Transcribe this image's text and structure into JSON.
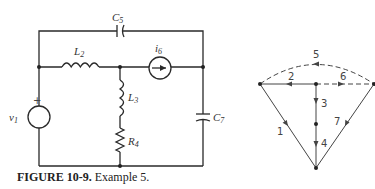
{
  "caption": {
    "label": "FIGURE 10-9.",
    "text": "Example 5."
  },
  "circuit": {
    "components": [
      {
        "id": "v1",
        "type": "voltage-source",
        "name": "v",
        "sub": "1",
        "polarity": "+"
      },
      {
        "id": "L2",
        "type": "inductor",
        "name": "L",
        "sub": "2"
      },
      {
        "id": "L3",
        "type": "inductor",
        "name": "L",
        "sub": "3"
      },
      {
        "id": "R4",
        "type": "resistor",
        "name": "R",
        "sub": "4"
      },
      {
        "id": "C5",
        "type": "capacitor",
        "name": "C",
        "sub": "5"
      },
      {
        "id": "i6",
        "type": "current-source",
        "name": "i",
        "sub": "6"
      },
      {
        "id": "C7",
        "type": "capacitor",
        "name": "C",
        "sub": "7"
      }
    ]
  },
  "graph": {
    "edges": [
      {
        "label": "1",
        "style": "solid"
      },
      {
        "label": "2",
        "style": "solid"
      },
      {
        "label": "3",
        "style": "solid"
      },
      {
        "label": "4",
        "style": "solid"
      },
      {
        "label": "5",
        "style": "dashed"
      },
      {
        "label": "6",
        "style": "dashed"
      },
      {
        "label": "7",
        "style": "solid"
      }
    ]
  }
}
